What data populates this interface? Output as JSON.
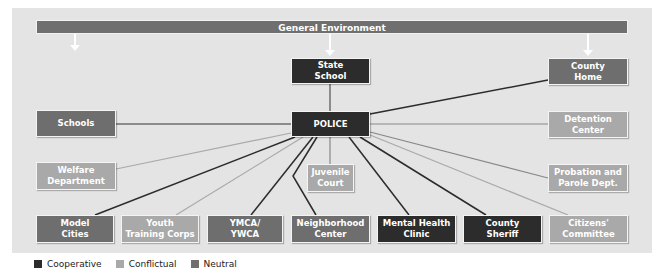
{
  "colors": {
    "cooperative": "#2c2c2c",
    "conflictual": "#a9a9a9",
    "neutral": "#6e6e6e",
    "panel_bg": "#e4e4e4",
    "bar_bg": "#6f6f6f"
  },
  "header": {
    "title": "General Environment"
  },
  "center": {
    "label": "POLICE",
    "relation": "cooperative"
  },
  "nodes": {
    "state_school": {
      "label": "State\nSchool",
      "relation": "cooperative",
      "line": "neutral"
    },
    "county_home": {
      "label": "County\nHome",
      "relation": "neutral",
      "line": "cooperative"
    },
    "schools": {
      "label": "Schools",
      "relation": "neutral",
      "line": "neutral"
    },
    "detention_center": {
      "label": "Detention\nCenter",
      "relation": "conflictual",
      "line": "neutral"
    },
    "welfare_department": {
      "label": "Welfare\nDepartment",
      "relation": "conflictual",
      "line": "conflictual"
    },
    "juvenile_court": {
      "label": "Juvenile\nCourt",
      "relation": "conflictual",
      "line": "neutral"
    },
    "probation_parole": {
      "label": "Probation and\nParole Dept.",
      "relation": "conflictual",
      "line": "neutral"
    },
    "model_cities": {
      "label": "Model\nCities",
      "relation": "neutral",
      "line": "cooperative"
    },
    "youth_training_corps": {
      "label": "Youth\nTraining Corps",
      "relation": "conflictual",
      "line": "conflictual"
    },
    "ymca_ywca": {
      "label": "YMCA/\nYWCA",
      "relation": "neutral",
      "line": "cooperative"
    },
    "neighborhood_center": {
      "label": "Neighborhood\nCenter",
      "relation": "neutral",
      "line": "cooperative"
    },
    "mental_health_clinic": {
      "label": "Mental Health\nClinic",
      "relation": "cooperative",
      "line": "cooperative"
    },
    "county_sheriff": {
      "label": "County\nSheriff",
      "relation": "cooperative",
      "line": "cooperative"
    },
    "citizens_committee": {
      "label": "Citizens'\nCommittee",
      "relation": "conflictual",
      "line": "conflictual"
    }
  },
  "legend": {
    "items": [
      {
        "label": "Cooperative",
        "key": "cooperative"
      },
      {
        "label": "Conflictual",
        "key": "conflictual"
      },
      {
        "label": "Neutral",
        "key": "neutral"
      }
    ]
  }
}
